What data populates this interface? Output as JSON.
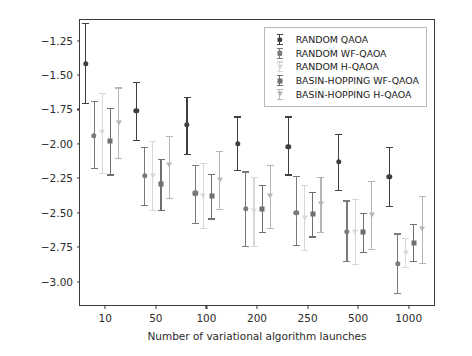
{
  "chart_data": {
    "type": "scatter",
    "title": "",
    "xlabel": "Number of variational algorithm launches",
    "ylabel": "Knapsack expectation value",
    "categories": [
      "10",
      "50",
      "100",
      "200",
      "250",
      "500",
      "1000"
    ],
    "ylim": [
      -3.17,
      -1.1
    ],
    "yticks": [
      "-1.25",
      "-1.50",
      "-1.75",
      "-2.00",
      "-2.25",
      "-2.50",
      "-2.75",
      "-3.00"
    ],
    "ytick_values": [
      -1.25,
      -1.5,
      -1.75,
      -2.0,
      -2.25,
      -2.5,
      -2.75,
      -3.0
    ],
    "grid": false,
    "legend_position": "upper right",
    "errorbars": true,
    "series": [
      {
        "name": "RANDOM QAOA",
        "color": "#3f3f3f",
        "marker": "circle",
        "values": [
          -1.42,
          -1.76,
          -1.86,
          -2.0,
          -2.02,
          -2.13,
          -2.24
        ],
        "err_lower": [
          -1.71,
          -1.98,
          -2.08,
          -2.2,
          -2.23,
          -2.34,
          -2.46
        ],
        "err_upper": [
          -1.12,
          -1.55,
          -1.66,
          -1.8,
          -1.8,
          -1.93,
          -2.02
        ]
      },
      {
        "name": "RANDOM WF-QAOA",
        "color": "#7a7a7a",
        "marker": "circle",
        "values": [
          -1.94,
          -2.23,
          -2.36,
          -2.47,
          -2.5,
          -2.64,
          -2.87
        ],
        "err_lower": [
          -2.18,
          -2.45,
          -2.58,
          -2.75,
          -2.74,
          -2.86,
          -3.09
        ],
        "err_upper": [
          -1.69,
          -2.02,
          -2.15,
          -2.2,
          -2.23,
          -2.41,
          -2.65
        ]
      },
      {
        "name": "RANDOM H-QAOA",
        "color": "#d8d8d8",
        "marker": "tri",
        "values": [
          -1.91,
          -2.23,
          -2.38,
          -2.49,
          -2.54,
          -2.64,
          -2.79
        ],
        "err_lower": [
          -2.22,
          -2.49,
          -2.62,
          -2.75,
          -2.78,
          -2.88,
          -2.9
        ],
        "err_upper": [
          -1.63,
          -1.98,
          -2.14,
          -2.24,
          -2.3,
          -2.4,
          -2.68
        ]
      },
      {
        "name": "BASIN-HOPPING WF-QAOA",
        "color": "#6f6f6f",
        "marker": "square",
        "values": [
          -1.98,
          -2.29,
          -2.38,
          -2.47,
          -2.51,
          -2.64,
          -2.72
        ],
        "err_lower": [
          -2.23,
          -2.49,
          -2.55,
          -2.65,
          -2.68,
          -2.79,
          -2.86
        ],
        "err_upper": [
          -1.74,
          -2.11,
          -2.22,
          -2.3,
          -2.35,
          -2.5,
          -2.58
        ]
      },
      {
        "name": "BASIN-HOPPING H-QAOA",
        "color": "#b5b5b5",
        "marker": "tri",
        "values": [
          -1.85,
          -2.15,
          -2.26,
          -2.38,
          -2.44,
          -2.52,
          -2.62
        ],
        "err_lower": [
          -2.11,
          -2.4,
          -2.48,
          -2.62,
          -2.65,
          -2.77,
          -2.87
        ],
        "err_upper": [
          -1.59,
          -1.94,
          -2.05,
          -2.15,
          -2.24,
          -2.27,
          -2.38
        ]
      }
    ]
  }
}
